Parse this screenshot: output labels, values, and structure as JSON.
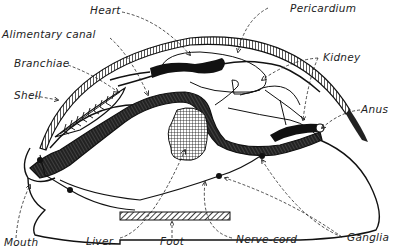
{
  "diagram": {
    "labels": {
      "heart": "Heart",
      "pericardium": "Pericardium",
      "alimentary_canal": "Alimentary canal",
      "kidney": "Kidney",
      "branchiae": "Branchiae",
      "shell": "Shell",
      "anus": "Anus",
      "mouth": "Mouth",
      "liver": "Liver",
      "foot": "Foot",
      "nerve_cord": "Nerve-cord",
      "ganglia": "Ganglia"
    },
    "colors": {
      "ink": "#1a1a1a",
      "background": "#ffffff"
    }
  }
}
